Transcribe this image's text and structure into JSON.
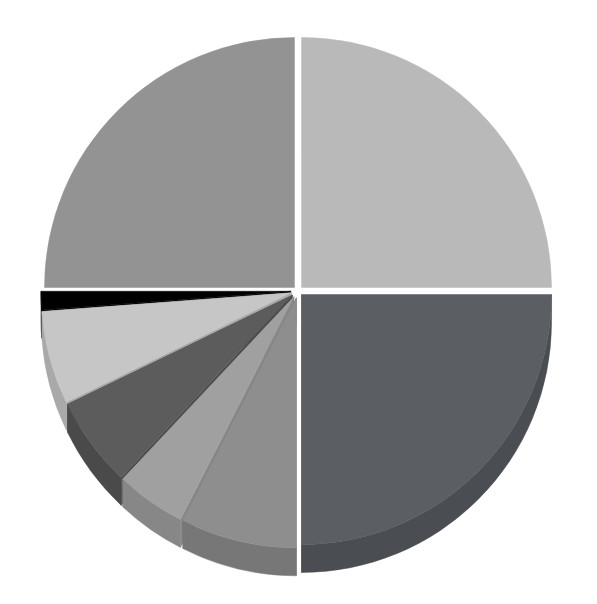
{
  "chart_data": {
    "type": "pie",
    "title": "",
    "subtitle": "",
    "xlabel": "",
    "ylabel": "",
    "legend": "none",
    "grid": false,
    "style": "3d-exploded",
    "labels_visible": false,
    "background_color": "#ffffff",
    "geometry": {
      "center_x": 298,
      "center_y": 291,
      "radius_x": 250,
      "radius_y": 250,
      "depth": 28,
      "explode_distance": 7,
      "start_angle_deg": 0,
      "direction": "counterclockwise"
    },
    "categories": [
      "Slice 1",
      "Slice 2",
      "Slice 3",
      "Slice 4",
      "Slice 5",
      "Slice 6",
      "Slice 7",
      "Slice 8",
      "Slice 9"
    ],
    "values": [
      25.0,
      25.0,
      1.2,
      6.0,
      5.8,
      4.5,
      7.5,
      25.0,
      0.0
    ],
    "percentages": [
      "25.0%",
      "25.0%",
      "1.2%",
      "6.0%",
      "5.8%",
      "4.5%",
      "7.5%",
      "25.0%",
      "0.0%"
    ],
    "slices": [
      {
        "name": "Slice 1",
        "value": 25.0,
        "percent": "25.0%",
        "start_deg": 0,
        "end_deg": 90,
        "top_color": "#b9b9b9",
        "side_color": "#a3a3a3",
        "explode": 5
      },
      {
        "name": "Slice 2",
        "value": 25.0,
        "percent": "25.0%",
        "start_deg": 90,
        "end_deg": 180,
        "top_color": "#939393",
        "side_color": "#7d7d7d",
        "explode": 5
      },
      {
        "name": "Slice 3",
        "value": 1.2,
        "percent": "1.2%",
        "start_deg": 180,
        "end_deg": 184.3,
        "top_color": "#000000",
        "side_color": "#000000",
        "explode": 7
      },
      {
        "name": "Slice 4",
        "value": 6.0,
        "percent": "6.0%",
        "start_deg": 184.3,
        "end_deg": 205.9,
        "top_color": "#c6c6c6",
        "side_color": "#a9a9a9",
        "explode": 7
      },
      {
        "name": "Slice 5",
        "value": 5.8,
        "percent": "5.8%",
        "start_deg": 205.9,
        "end_deg": 226.8,
        "top_color": "#5c5c5c",
        "side_color": "#4a4a4a",
        "explode": 7
      },
      {
        "name": "Slice 6",
        "value": 4.5,
        "percent": "4.5%",
        "start_deg": 226.8,
        "end_deg": 243.0,
        "top_color": "#a0a0a0",
        "side_color": "#878787",
        "explode": 7
      },
      {
        "name": "Slice 7",
        "value": 7.5,
        "percent": "7.5%",
        "start_deg": 243.0,
        "end_deg": 270.0,
        "top_color": "#8e8e8e",
        "side_color": "#777777",
        "explode": 7
      },
      {
        "name": "Slice 8",
        "value": 25.0,
        "percent": "25.0%",
        "start_deg": 270.0,
        "end_deg": 360.0,
        "top_color": "#5b5f63",
        "side_color": "#4a4e52",
        "explode": 5
      }
    ],
    "colors": [
      "#b9b9b9",
      "#939393",
      "#000000",
      "#c6c6c6",
      "#5c5c5c",
      "#a0a0a0",
      "#8e8e8e",
      "#5b5f63"
    ]
  },
  "figure": {
    "canvas_width": 597,
    "canvas_height": 604,
    "has_axes": false,
    "has_legend": false,
    "has_title": false
  }
}
